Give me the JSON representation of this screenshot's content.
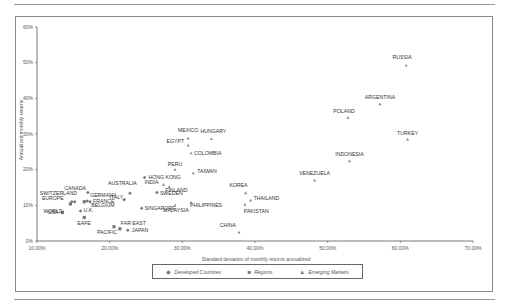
{
  "chart_data": {
    "type": "scatter",
    "title": "",
    "xlabel": "Standard deviation of monthly returns annualized",
    "ylabel": "Annualized monthly returns",
    "xlim": [
      10,
      70
    ],
    "ylim": [
      0,
      60
    ],
    "x_ticks": [
      "10.00%",
      "20.00%",
      "30.00%",
      "40.00%",
      "50.00%",
      "60.00%",
      "70.00%"
    ],
    "y_ticks": [
      "0%",
      "10%",
      "20%",
      "30%",
      "40%",
      "50%",
      "60%"
    ],
    "grid": false,
    "legend_position": "bottom",
    "series": [
      {
        "name": "Developed Countries",
        "marker": "diamond",
        "points": [
          {
            "label": "SWITZERLAND",
            "x": 15.2,
            "y": 11.0
          },
          {
            "label": "EUROPE",
            "x": 14.8,
            "y": 11.0
          },
          {
            "label": "CANADA",
            "x": 17.0,
            "y": 13.6
          },
          {
            "label": "GERMANY",
            "x": 16.9,
            "y": 11.2
          },
          {
            "label": "FRANCE",
            "x": 17.3,
            "y": 11.0
          },
          {
            "label": "U.K.",
            "x": 16.0,
            "y": 8.4
          },
          {
            "label": "AUSTRALIA",
            "x": 22.8,
            "y": 13.4
          },
          {
            "label": "HONG KONG",
            "x": 24.8,
            "y": 17.8
          },
          {
            "label": "ITALY",
            "x": 22.0,
            "y": 11.6
          },
          {
            "label": "SWEDEN",
            "x": 26.5,
            "y": 13.6
          },
          {
            "label": "SINGAPORE",
            "x": 24.4,
            "y": 9.2
          },
          {
            "label": "JAPAN",
            "x": 22.5,
            "y": 3.0
          }
        ]
      },
      {
        "name": "Regions",
        "marker": "square",
        "points": [
          {
            "label": "USA",
            "x": 13.5,
            "y": 8.0
          },
          {
            "label": "WORLD",
            "x": 14.6,
            "y": 10.4
          },
          {
            "label": "EAFE",
            "x": 16.5,
            "y": 6.6
          },
          {
            "label": "BELGIUM",
            "x": 16.5,
            "y": 11.0
          },
          {
            "label": "FAR EAST",
            "x": 21.4,
            "y": 3.4
          },
          {
            "label": "PACIFIC",
            "x": 20.6,
            "y": 4.0
          }
        ]
      },
      {
        "name": "Emerging Markets",
        "marker": "triangle",
        "points": [
          {
            "label": "RUSSIA",
            "x": 60.8,
            "y": 49.2
          },
          {
            "label": "ARGENTINA",
            "x": 57.2,
            "y": 38.4
          },
          {
            "label": "POLAND",
            "x": 52.8,
            "y": 34.6
          },
          {
            "label": "TURKEY",
            "x": 61.0,
            "y": 28.4
          },
          {
            "label": "INDONESIA",
            "x": 53.0,
            "y": 22.4
          },
          {
            "label": "VENEZUELA",
            "x": 48.2,
            "y": 17.0
          },
          {
            "label": "MEXICO",
            "x": 30.8,
            "y": 28.8
          },
          {
            "label": "HUNGARY",
            "x": 34.0,
            "y": 28.6
          },
          {
            "label": "EGYPT",
            "x": 30.8,
            "y": 26.8
          },
          {
            "label": "COLOMBIA",
            "x": 31.2,
            "y": 24.6
          },
          {
            "label": "PERU",
            "x": 29.0,
            "y": 20.0
          },
          {
            "label": "TAIWAN",
            "x": 31.5,
            "y": 19.0
          },
          {
            "label": "INDIA",
            "x": 27.4,
            "y": 15.8
          },
          {
            "label": "FINLAND",
            "x": 28.2,
            "y": 15.2
          },
          {
            "label": "MALAYSIA",
            "x": 29.0,
            "y": 10.0
          },
          {
            "label": "PHILIPPINES",
            "x": 31.2,
            "y": 10.8
          },
          {
            "label": "KOREA",
            "x": 38.7,
            "y": 13.4
          },
          {
            "label": "THAILAND",
            "x": 39.4,
            "y": 11.4
          },
          {
            "label": "PAKISTAN",
            "x": 38.6,
            "y": 10.2
          },
          {
            "label": "CHINA",
            "x": 37.8,
            "y": 2.4
          }
        ]
      }
    ]
  },
  "legend": {
    "items": [
      {
        "label": "Developed Countries",
        "symbol": "◆"
      },
      {
        "label": "Regions",
        "symbol": "■"
      },
      {
        "label": "Emerging Markets",
        "symbol": "▲"
      }
    ]
  }
}
